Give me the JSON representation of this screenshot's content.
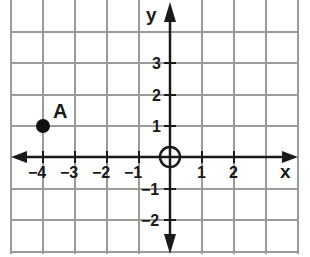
{
  "diagram": {
    "type": "coordinate-grid",
    "axes": {
      "x_label": "x",
      "y_label": "y",
      "x_ticks": [
        {
          "value": -4,
          "label": "−4"
        },
        {
          "value": -3,
          "label": "−3"
        },
        {
          "value": -2,
          "label": "−2"
        },
        {
          "value": -1,
          "label": "−1"
        },
        {
          "value": 1,
          "label": "1"
        },
        {
          "value": 2,
          "label": "2"
        }
      ],
      "y_ticks": [
        {
          "value": 3,
          "label": "3"
        },
        {
          "value": 2,
          "label": "2"
        },
        {
          "value": 1,
          "label": "1"
        },
        {
          "value": -1,
          "label": "−1"
        },
        {
          "value": -2,
          "label": "−2"
        }
      ],
      "x_range": [
        -5,
        4
      ],
      "y_range": [
        -3,
        5
      ]
    },
    "points": [
      {
        "label": "A",
        "x": -4,
        "y": 1
      }
    ],
    "origin_marker": "circle-crosshair",
    "colors": {
      "grid": "#9a9a9a",
      "axis": "#1a1a1a",
      "point": "#111111",
      "background": "#ffffff"
    }
  }
}
